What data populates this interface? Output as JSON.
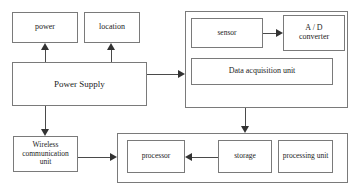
{
  "diagram": {
    "stroke_color": "#7a7a7a",
    "arrow_color": "#333333",
    "background": "#ffffff"
  },
  "nodes": {
    "power": {
      "label": "power"
    },
    "location": {
      "label": "location"
    },
    "power_supply": {
      "label": "Power Supply"
    },
    "wireless": {
      "label": "Wireless\ncommunication\nunit",
      "line1": "Wireless",
      "line2": "communication",
      "line3": "unit"
    },
    "sensor": {
      "label": "sensor"
    },
    "adc": {
      "label": "A / D\nconverter",
      "line1": "A / D",
      "line2": "converter"
    },
    "data_acquisition_unit": {
      "label": "Data acquisition unit"
    },
    "processor": {
      "label": "processor"
    },
    "storage": {
      "label": "storage"
    },
    "processing_unit": {
      "label": "processing unit"
    }
  },
  "groups": {
    "acquisition_group": {
      "label": ""
    },
    "processing_group": {
      "label": ""
    }
  },
  "connections": [
    {
      "from": "power_supply",
      "to": "power",
      "direction": "up"
    },
    {
      "from": "power_supply",
      "to": "location",
      "direction": "up"
    },
    {
      "from": "power_supply",
      "to": "acquisition_group",
      "direction": "right"
    },
    {
      "from": "power_supply",
      "to": "wireless",
      "direction": "down"
    },
    {
      "from": "wireless",
      "to": "processing_group",
      "direction": "right"
    },
    {
      "from": "sensor",
      "to": "adc",
      "direction": "right"
    },
    {
      "from": "acquisition_group",
      "to": "processing_group",
      "direction": "down"
    },
    {
      "from": "storage",
      "to": "processor",
      "direction": "left"
    }
  ]
}
